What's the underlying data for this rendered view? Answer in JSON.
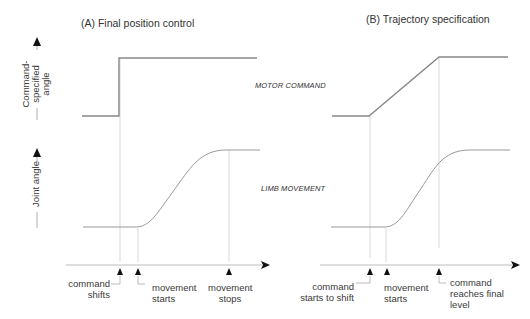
{
  "panels": {
    "a": {
      "title": "(A) Final position control",
      "markers": [
        {
          "label_line1": "command",
          "label_line2": "shifts"
        },
        {
          "label_line1": "movement",
          "label_line2": "starts"
        },
        {
          "label_line1": "movement",
          "label_line2": "stops"
        }
      ]
    },
    "b": {
      "title": "(B) Trajectory specification",
      "markers": [
        {
          "label_line1": "command",
          "label_line2": "starts to shift"
        },
        {
          "label_line1": "movement",
          "label_line2": "starts"
        },
        {
          "label_line1": "command",
          "label_line2": "reaches final",
          "label_line3": "level"
        }
      ]
    }
  },
  "row_labels": {
    "motor_command": "MOTOR COMMAND",
    "limb_movement": "LIMB MOVEMENT"
  },
  "y_axes": {
    "top": {
      "line1": "Command-",
      "line2": "specified",
      "line3": "angle"
    },
    "bottom": {
      "line1": "Joint angle"
    }
  },
  "colors": {
    "signal": "#888888",
    "guide": "#c8c8c8",
    "axis": "#aaaaaa",
    "arrow": "#111111"
  }
}
